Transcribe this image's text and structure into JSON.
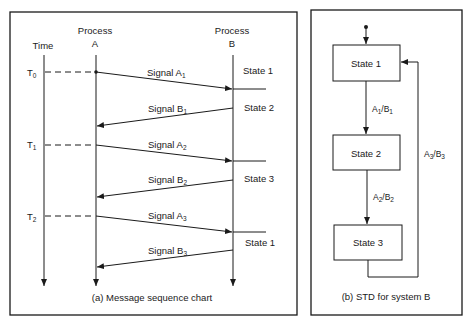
{
  "panel_a": {
    "caption": "(a) Message sequence chart",
    "time_label": "Time",
    "process_a": {
      "line1": "Process",
      "line2": "A"
    },
    "process_b": {
      "line1": "Process",
      "line2": "B"
    },
    "time_marks": [
      {
        "base": "T",
        "sub": "0"
      },
      {
        "base": "T",
        "sub": "1"
      },
      {
        "base": "T",
        "sub": "2"
      }
    ],
    "signals": [
      {
        "base": "Signal A",
        "sub": "1",
        "direction": "A-to-B"
      },
      {
        "base": "Signal B",
        "sub": "1",
        "direction": "B-to-A"
      },
      {
        "base": "Signal A",
        "sub": "2",
        "direction": "A-to-B"
      },
      {
        "base": "Signal B",
        "sub": "2",
        "direction": "B-to-A"
      },
      {
        "base": "Signal A",
        "sub": "3",
        "direction": "A-to-B"
      },
      {
        "base": "Signal B",
        "sub": "3",
        "direction": "B-to-A"
      }
    ],
    "states": [
      "State 1",
      "State 2",
      "State 3",
      "State 1"
    ]
  },
  "panel_b": {
    "caption": "(b) STD for system B",
    "states": [
      "State 1",
      "State 2",
      "State 3"
    ],
    "transitions": [
      {
        "a": "A",
        "a_sub": "1",
        "b": "B",
        "b_sub": "1",
        "from": "State 1",
        "to": "State 2"
      },
      {
        "a": "A",
        "a_sub": "2",
        "b": "B",
        "b_sub": "2",
        "from": "State 2",
        "to": "State 3"
      },
      {
        "a": "A",
        "a_sub": "3",
        "b": "B",
        "b_sub": "3",
        "from": "State 3",
        "to": "State 1"
      }
    ]
  },
  "colors": {
    "ink": "#1a1a1a",
    "paper": "#ffffff"
  }
}
